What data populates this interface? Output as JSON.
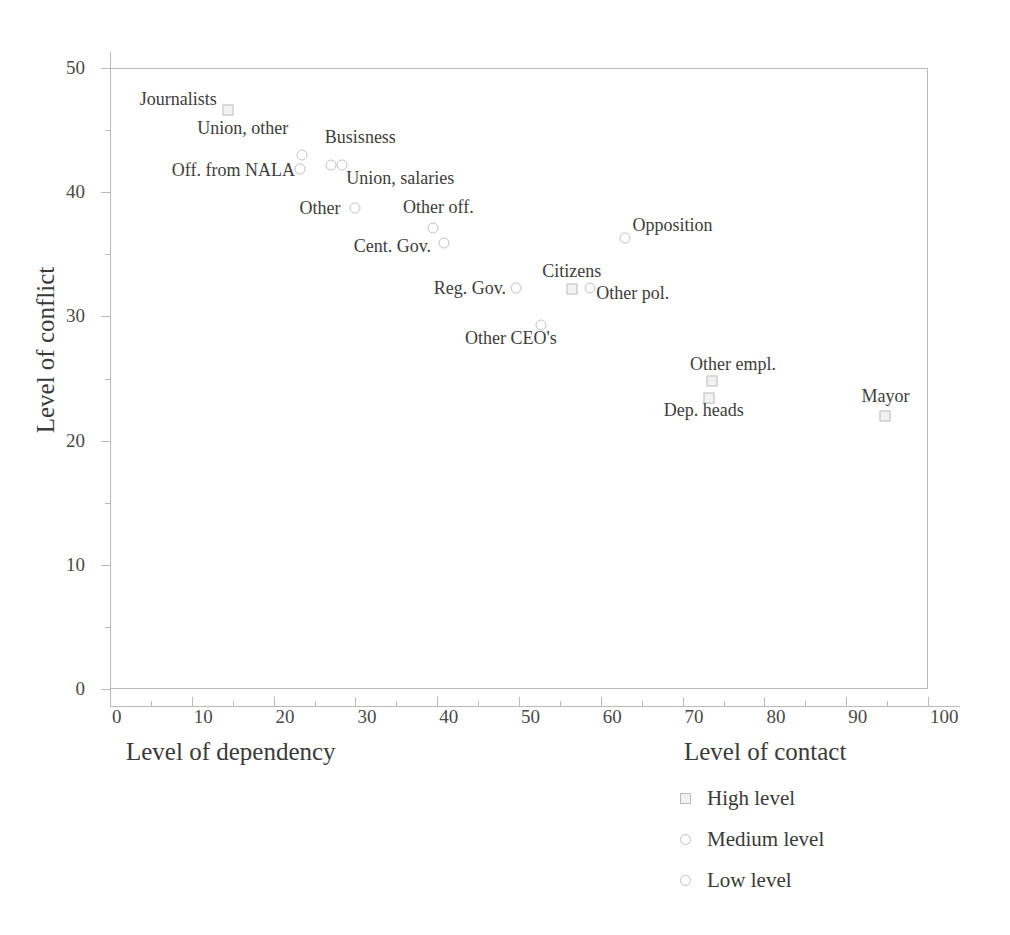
{
  "chart_data": {
    "type": "scatter",
    "title": "",
    "xlabel": "Level of dependency",
    "xlabel_secondary": "Level of contact",
    "ylabel": "Level of conflict",
    "xlim": [
      0,
      100
    ],
    "ylim": [
      0,
      50
    ],
    "xticks": [
      0,
      10,
      20,
      30,
      40,
      50,
      60,
      70,
      80,
      90,
      100
    ],
    "yticks": [
      0,
      10,
      20,
      30,
      40,
      50
    ],
    "xtick_labels": [
      "0",
      "10",
      "20",
      "30",
      "40",
      "50",
      "60",
      "70",
      "80",
      "90",
      "100"
    ],
    "ytick_labels": [
      "0",
      "10",
      "20",
      "30",
      "40",
      "50"
    ],
    "grid": false,
    "legend_position": "bottom-right",
    "points": [
      {
        "label": "Journalists",
        "x": 14.4,
        "y": 46.6,
        "marker": "square",
        "label_dx": -88,
        "label_dy": -10
      },
      {
        "label": "Union, other",
        "x": 23.5,
        "y": 43.0,
        "marker": "circle",
        "label_dx": -105,
        "label_dy": -26
      },
      {
        "label": "Off. from NALA",
        "x": 23.2,
        "y": 41.9,
        "marker": "circle",
        "label_dx": -128,
        "label_dy": 2
      },
      {
        "label": "Busisness",
        "x": 27.0,
        "y": 42.2,
        "marker": "circle",
        "label_dx": -6,
        "label_dy": -27
      },
      {
        "label": "Union, salaries",
        "x": 28.4,
        "y": 42.2,
        "marker": "circle",
        "label_dx": 4,
        "label_dy": 14
      },
      {
        "label": "Other",
        "x": 30.0,
        "y": 38.7,
        "marker": "circle",
        "label_dx": -56,
        "label_dy": 1
      },
      {
        "label": "Other  off.",
        "x": 39.5,
        "y": 37.1,
        "marker": "circle",
        "label_dx": -30,
        "label_dy": -20
      },
      {
        "label": "Cent. Gov.",
        "x": 40.8,
        "y": 35.9,
        "marker": "circle",
        "label_dx": -90,
        "label_dy": 4
      },
      {
        "label": "Opposition",
        "x": 62.9,
        "y": 36.3,
        "marker": "circle",
        "label_dx": 8,
        "label_dy": -12
      },
      {
        "label": "Reg. Gov.",
        "x": 49.6,
        "y": 32.3,
        "marker": "circle",
        "label_dx": -82,
        "label_dy": 1
      },
      {
        "label": "Citizens",
        "x": 56.5,
        "y": 32.2,
        "marker": "square",
        "label_dx": -30,
        "label_dy": -17
      },
      {
        "label": "Other pol.",
        "x": 58.7,
        "y": 32.3,
        "marker": "circle",
        "label_dx": 6,
        "label_dy": 6
      },
      {
        "label": "Other CEO's",
        "x": 52.7,
        "y": 29.3,
        "marker": "circle",
        "label_dx": -76,
        "label_dy": 14
      },
      {
        "label": "Other empl.",
        "x": 73.6,
        "y": 24.8,
        "marker": "square",
        "label_dx": -22,
        "label_dy": -16
      },
      {
        "label": "Dep. heads",
        "x": 73.2,
        "y": 23.4,
        "marker": "square",
        "label_dx": -45,
        "label_dy": 13
      },
      {
        "label": "Mayor",
        "x": 94.8,
        "y": 22.0,
        "marker": "square",
        "label_dx": -24,
        "label_dy": -19
      }
    ],
    "legend": [
      {
        "label": "High level",
        "marker": "square"
      },
      {
        "label": "Medium level",
        "marker": "circle"
      },
      {
        "label": "Low level",
        "marker": "circle"
      }
    ]
  }
}
